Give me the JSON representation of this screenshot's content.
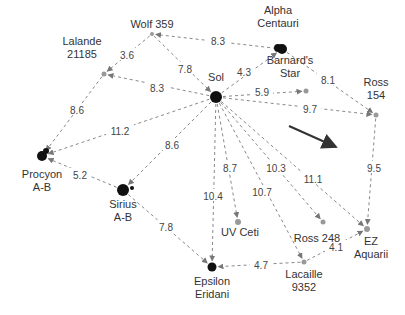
{
  "diagram": {
    "colors": {
      "edge": "#888888",
      "star_large": "#111111",
      "star_small": "#999999",
      "label": "#333333",
      "arrow": "#333333"
    },
    "nodes": [
      {
        "id": "sol",
        "label": [
          "Sol"
        ],
        "x": 216,
        "y": 97,
        "r": 6,
        "color": "#111111"
      },
      {
        "id": "wolf359",
        "label": [
          "Wolf 359"
        ],
        "x": 152,
        "y": 34,
        "r": 2,
        "color": "#999999"
      },
      {
        "id": "lalande",
        "label": [
          "Lalande",
          "21185"
        ],
        "x": 104,
        "y": 74,
        "r": 2.5,
        "color": "#999999"
      },
      {
        "id": "alpha",
        "label": [
          "Alpha",
          "Centauri"
        ],
        "x": 282,
        "y": 49,
        "r": 5,
        "color": "#111111"
      },
      {
        "id": "barnard",
        "label": [
          "Barnard's",
          "Star"
        ],
        "x": 306,
        "y": 91,
        "r": 2.5,
        "color": "#999999"
      },
      {
        "id": "ross154",
        "label": [
          "Ross",
          "154"
        ],
        "x": 376,
        "y": 115,
        "r": 2.5,
        "color": "#999999"
      },
      {
        "id": "procyon",
        "label": [
          "Procyon",
          "A-B"
        ],
        "x": 42,
        "y": 156,
        "r": 5,
        "color": "#111111"
      },
      {
        "id": "sirius",
        "label": [
          "Sirius",
          "A-B"
        ],
        "x": 123,
        "y": 190,
        "r": 6,
        "color": "#111111"
      },
      {
        "id": "uvceti",
        "label": [
          "UV Ceti"
        ],
        "x": 238,
        "y": 222,
        "r": 3,
        "color": "#999999"
      },
      {
        "id": "ross248",
        "label": [
          "Ross 248"
        ],
        "x": 323,
        "y": 222,
        "r": 2.5,
        "color": "#999999"
      },
      {
        "id": "ezaq",
        "label": [
          "EZ",
          "Aquarii"
        ],
        "x": 367,
        "y": 229,
        "r": 3,
        "color": "#999999"
      },
      {
        "id": "epsilon",
        "label": [
          "Epsilon",
          "Eridani"
        ],
        "x": 212,
        "y": 267,
        "r": 4.5,
        "color": "#111111"
      },
      {
        "id": "lacaille",
        "label": [
          "Lacaille",
          "9352"
        ],
        "x": 304,
        "y": 262,
        "r": 2.5,
        "color": "#999999"
      }
    ],
    "edges": [
      {
        "from": "wolf359",
        "to": "lalande",
        "label": "3.6",
        "lx": 127,
        "ly": 55
      },
      {
        "from": "wolf359",
        "to": "sol",
        "label": "7.8",
        "lx": 185,
        "ly": 69
      },
      {
        "from": "alpha",
        "to": "wolf359",
        "label": "8.3",
        "lx": 218,
        "ly": 41
      },
      {
        "from": "sol",
        "to": "lalande",
        "label": "8.3",
        "lx": 157,
        "ly": 88
      },
      {
        "from": "sol",
        "to": "alpha",
        "label": "4.3",
        "lx": 244,
        "ly": 72
      },
      {
        "from": "sol",
        "to": "barnard",
        "label": "5.9",
        "lx": 262,
        "ly": 92
      },
      {
        "from": "alpha",
        "to": "ross154",
        "label": "8.1",
        "lx": 328,
        "ly": 80
      },
      {
        "from": "sol",
        "to": "ross154",
        "label": "9.7",
        "lx": 310,
        "ly": 109
      },
      {
        "from": "lalande",
        "to": "procyon",
        "label": "8.6",
        "lx": 77,
        "ly": 110
      },
      {
        "from": "sol",
        "to": "procyon",
        "label": "11.2",
        "lx": 120,
        "ly": 131
      },
      {
        "from": "sol",
        "to": "sirius",
        "label": "8.6",
        "lx": 172,
        "ly": 145
      },
      {
        "from": "sirius",
        "to": "procyon",
        "label": "5.2",
        "lx": 80,
        "ly": 175
      },
      {
        "from": "sol",
        "to": "uvceti",
        "label": "8.7",
        "lx": 230,
        "ly": 168
      },
      {
        "from": "sol",
        "to": "epsilon",
        "label": "10.4",
        "lx": 213,
        "ly": 196
      },
      {
        "from": "sol",
        "to": "lacaille",
        "label": "10.7",
        "lx": 262,
        "ly": 192
      },
      {
        "from": "sol",
        "to": "ross248",
        "label": "10.3",
        "lx": 276,
        "ly": 168
      },
      {
        "from": "sol",
        "to": "ezaq",
        "label": "11.1",
        "lx": 313,
        "ly": 179
      },
      {
        "from": "ross154",
        "to": "ezaq",
        "label": "9.5",
        "lx": 374,
        "ly": 168
      },
      {
        "from": "sirius",
        "to": "epsilon",
        "label": "7.8",
        "lx": 166,
        "ly": 227
      },
      {
        "from": "lacaille",
        "to": "ezaq",
        "label": "4.1",
        "lx": 336,
        "ly": 247
      },
      {
        "from": "lacaille",
        "to": "epsilon",
        "label": "4.7",
        "lx": 261,
        "ly": 265
      }
    ],
    "direction_arrow": {
      "x1": 289,
      "y1": 126,
      "x2": 336,
      "y2": 147
    }
  }
}
